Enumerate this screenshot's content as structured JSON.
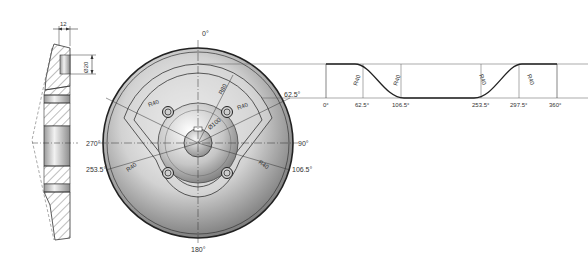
{
  "section_view": {
    "width_dim": "12",
    "bore_dim": "Ø20"
  },
  "face_view": {
    "angle_labels": {
      "top": "0°",
      "right": "90°",
      "bottom": "180°",
      "left": "270°",
      "a62": "62.5°",
      "a106": "106.5°",
      "a253": "253.5°"
    },
    "radius_labels": {
      "r1": "R40",
      "r2": "R40",
      "r3": "R40",
      "r4": "R40",
      "r80": "R80",
      "d100": "Ø100"
    }
  },
  "profile": {
    "ticks": [
      "0°",
      "62.5°",
      "106.5°",
      "253.5°",
      "297.5°",
      "360°"
    ],
    "fillets": [
      "R40",
      "R40",
      "R40",
      "R40"
    ]
  }
}
